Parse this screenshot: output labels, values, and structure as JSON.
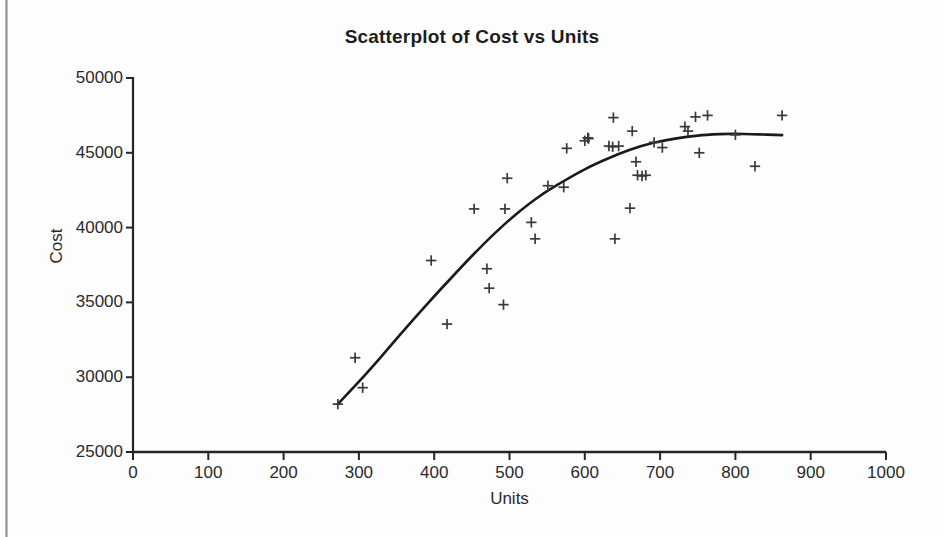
{
  "chart_data": {
    "type": "scatter",
    "title": "Scatterplot of Cost vs Units",
    "xlabel": "Units",
    "ylabel": "Cost",
    "xlim": [
      0,
      1000
    ],
    "ylim": [
      25000,
      50000
    ],
    "xticks": [
      0,
      100,
      200,
      300,
      400,
      500,
      600,
      700,
      800,
      900,
      1000
    ],
    "yticks": [
      25000,
      30000,
      35000,
      40000,
      45000,
      50000
    ],
    "xtick_labels": [
      "0",
      "100",
      "200",
      "300",
      "400",
      "500",
      "600",
      "700",
      "800",
      "900",
      "1000"
    ],
    "ytick_labels": [
      "25000",
      "30000",
      "35000",
      "40000",
      "45000",
      "50000"
    ],
    "grid": false,
    "legend": false,
    "marker": "plus",
    "marker_color": "#3a3a3a",
    "fit_line_color": "#1a1a1a",
    "fit_line_label": "smoothed fitted curve",
    "points": [
      {
        "x": 272,
        "y": 28200
      },
      {
        "x": 295,
        "y": 31300
      },
      {
        "x": 305,
        "y": 29300
      },
      {
        "x": 396,
        "y": 37800
      },
      {
        "x": 417,
        "y": 33550
      },
      {
        "x": 453,
        "y": 41250
      },
      {
        "x": 470,
        "y": 37250
      },
      {
        "x": 473,
        "y": 35950
      },
      {
        "x": 492,
        "y": 34850
      },
      {
        "x": 494,
        "y": 41250
      },
      {
        "x": 497,
        "y": 43300
      },
      {
        "x": 529,
        "y": 40350
      },
      {
        "x": 534,
        "y": 39250
      },
      {
        "x": 551,
        "y": 42800
      },
      {
        "x": 572,
        "y": 42700
      },
      {
        "x": 576,
        "y": 45300
      },
      {
        "x": 600,
        "y": 45800
      },
      {
        "x": 604,
        "y": 46000
      },
      {
        "x": 605,
        "y": 45950
      },
      {
        "x": 632,
        "y": 45450
      },
      {
        "x": 637,
        "y": 45400
      },
      {
        "x": 638,
        "y": 47350
      },
      {
        "x": 640,
        "y": 39250
      },
      {
        "x": 645,
        "y": 45450
      },
      {
        "x": 660,
        "y": 41300
      },
      {
        "x": 663,
        "y": 46450
      },
      {
        "x": 668,
        "y": 44400
      },
      {
        "x": 670,
        "y": 43500
      },
      {
        "x": 676,
        "y": 43450
      },
      {
        "x": 681,
        "y": 43500
      },
      {
        "x": 692,
        "y": 45700
      },
      {
        "x": 703,
        "y": 45350
      },
      {
        "x": 733,
        "y": 46750
      },
      {
        "x": 737,
        "y": 46450
      },
      {
        "x": 747,
        "y": 47400
      },
      {
        "x": 752,
        "y": 45000
      },
      {
        "x": 763,
        "y": 47500
      },
      {
        "x": 800,
        "y": 46200
      },
      {
        "x": 826,
        "y": 44100
      },
      {
        "x": 862,
        "y": 47500
      }
    ],
    "fit_curve": [
      {
        "x": 272,
        "y": 28200
      },
      {
        "x": 300,
        "y": 29700
      },
      {
        "x": 330,
        "y": 31400
      },
      {
        "x": 360,
        "y": 33150
      },
      {
        "x": 390,
        "y": 34850
      },
      {
        "x": 420,
        "y": 36500
      },
      {
        "x": 450,
        "y": 38100
      },
      {
        "x": 480,
        "y": 39600
      },
      {
        "x": 510,
        "y": 40950
      },
      {
        "x": 540,
        "y": 42100
      },
      {
        "x": 570,
        "y": 43050
      },
      {
        "x": 600,
        "y": 43900
      },
      {
        "x": 630,
        "y": 44600
      },
      {
        "x": 660,
        "y": 45200
      },
      {
        "x": 690,
        "y": 45650
      },
      {
        "x": 720,
        "y": 45950
      },
      {
        "x": 750,
        "y": 46150
      },
      {
        "x": 780,
        "y": 46250
      },
      {
        "x": 800,
        "y": 46270
      },
      {
        "x": 830,
        "y": 46230
      },
      {
        "x": 862,
        "y": 46180
      }
    ]
  }
}
